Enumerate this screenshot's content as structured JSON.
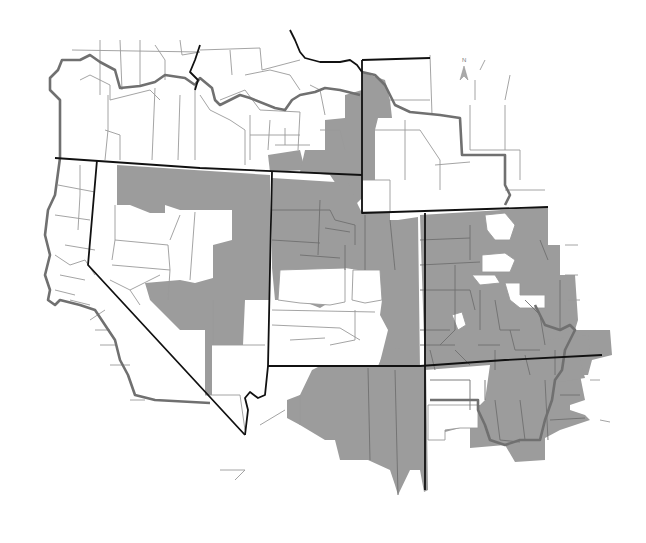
{
  "map": {
    "type": "choropleth",
    "description": "Grayscale county map of the western/southwestern United States with selected counties shaded",
    "colors": {
      "shaded_county": "#9c9c9c",
      "unshaded_county": "#ffffff",
      "county_line": "#9a9a9a",
      "region_border": "#707070",
      "state_border": "#111111"
    },
    "north_arrow": {
      "label": "N",
      "icon": "north-arrow-icon"
    },
    "regions": [
      {
        "name": "northwest-region",
        "shaded": false
      },
      {
        "name": "nevada-region",
        "shaded": "partial"
      },
      {
        "name": "utah-region",
        "shaded": "partial"
      },
      {
        "name": "wyoming-region",
        "shaded": "partial"
      },
      {
        "name": "colorado-region",
        "shaded": "mostly"
      },
      {
        "name": "arizona-region",
        "shaded": "partial"
      },
      {
        "name": "new-mexico-region",
        "shaded": "mostly"
      },
      {
        "name": "california-region",
        "shaded": false
      }
    ]
  }
}
